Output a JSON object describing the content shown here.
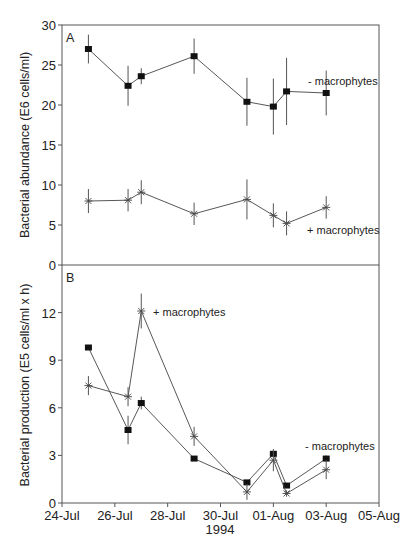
{
  "chart_data": [
    {
      "panel": "A",
      "type": "line",
      "ylabel": "Bacterial abundance (E6 cells/ml)",
      "xlabel": "",
      "ylim": [
        0,
        30
      ],
      "yticks": [
        0,
        5,
        10,
        15,
        20,
        25,
        30
      ],
      "x": [
        "25-Jul",
        "26.5-Jul",
        "27-Jul",
        "29-Jul",
        "31-Jul",
        "01-Aug",
        "01.5-Aug",
        "03-Aug"
      ],
      "x_days": [
        1,
        2.5,
        3,
        5,
        7,
        8,
        8.5,
        10
      ],
      "series": [
        {
          "name": "- macrophytes",
          "marker": "square",
          "values": [
            27.0,
            22.4,
            23.6,
            26.1,
            20.4,
            19.8,
            21.7,
            21.5
          ],
          "err": [
            1.8,
            2.5,
            1.0,
            2.2,
            3.0,
            3.5,
            4.2,
            2.8
          ]
        },
        {
          "name": "+ macrophytes",
          "marker": "star",
          "values": [
            8.0,
            8.1,
            9.1,
            6.4,
            8.2,
            6.2,
            5.2,
            7.2
          ],
          "err": [
            1.5,
            1.4,
            1.5,
            1.4,
            2.5,
            1.5,
            1.5,
            1.4
          ]
        }
      ]
    },
    {
      "panel": "B",
      "type": "line",
      "ylabel": "Bacterial production (E5 cells/ml x h)",
      "xlabel": "1994",
      "ylim": [
        0,
        15
      ],
      "yticks": [
        0,
        3,
        6,
        9,
        12
      ],
      "xticks": [
        "24-Jul",
        "26-Jul",
        "28-Jul",
        "30-Jul",
        "01-Aug",
        "03-Aug",
        "05-Aug"
      ],
      "x": [
        "25-Jul",
        "26.5-Jul",
        "27-Jul",
        "29-Jul",
        "31-Jul",
        "01-Aug",
        "01.5-Aug",
        "03-Aug"
      ],
      "x_days": [
        1,
        2.5,
        3,
        5,
        7,
        8,
        8.5,
        10
      ],
      "series": [
        {
          "name": "- macrophytes",
          "marker": "square",
          "values": [
            9.8,
            4.6,
            6.3,
            2.8,
            1.3,
            3.1,
            1.1,
            2.8
          ],
          "err": [
            0.1,
            0.9,
            0.4,
            0.1,
            0.1,
            0.2,
            0.1,
            0.2
          ]
        },
        {
          "name": "+ macrophytes",
          "marker": "star",
          "values": [
            7.4,
            6.7,
            12.1,
            4.2,
            0.7,
            2.7,
            0.6,
            2.1
          ],
          "err": [
            0.6,
            0.6,
            1.1,
            0.6,
            0.5,
            0.7,
            0.2,
            0.6
          ]
        }
      ]
    }
  ],
  "labels": {
    "panel_a": "A",
    "panel_b": "B",
    "ylabel_a": "Bacterial abundance (E6 cells/ml)",
    "ylabel_b": "Bacterial production (E5 cells/ml x h)",
    "year": "1994",
    "ann_a_minus": "- macrophytes",
    "ann_a_plus": "+ macrophytes",
    "ann_b_plus": "+ macrophytes",
    "ann_b_minus": "- macrophytes"
  },
  "axes": {
    "a_yticks": [
      "0",
      "5",
      "10",
      "15",
      "20",
      "25",
      "30"
    ],
    "b_yticks": [
      "0",
      "3",
      "6",
      "9",
      "12"
    ],
    "xticks": [
      "24-Jul",
      "26-Jul",
      "28-Jul",
      "30-Jul",
      "01-Aug",
      "03-Aug",
      "05-Aug"
    ]
  }
}
